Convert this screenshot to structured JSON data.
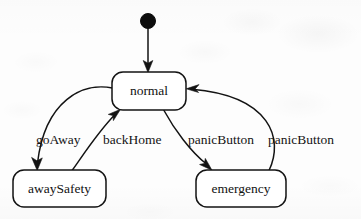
{
  "diagram": {
    "type": "uml-state-machine",
    "title": "",
    "background_color": "#fdfdfd",
    "stroke_color": "#131313",
    "initial_state": {
      "name": "initial-pseudostate",
      "shape": "filled-circle",
      "cx": 148,
      "cy": 21,
      "r": 7.5
    },
    "states": [
      {
        "id": "normal",
        "label": "normal",
        "x": 112,
        "y": 72,
        "width": 74,
        "height": 38,
        "rx": 11
      },
      {
        "id": "awaySafety",
        "label": "awaySafety",
        "x": 13,
        "y": 170,
        "width": 93,
        "height": 37,
        "rx": 11
      },
      {
        "id": "emergency",
        "label": "emergency",
        "x": 196,
        "y": 170,
        "width": 90,
        "height": 37,
        "rx": 11
      }
    ],
    "transitions": [
      {
        "id": "initial-to-normal",
        "label": "",
        "from": "initial-pseudostate",
        "to": "normal",
        "path": "M 148 29 L 148 68",
        "arrow_tip": {
          "x": 148,
          "y": 72,
          "angle": 90
        }
      },
      {
        "id": "normal-to-awaySafety",
        "label": "goAway",
        "from": "normal",
        "to": "awaySafety",
        "label_x": 36,
        "label_y": 141,
        "path": "M 113 87 C 80 84, 42 104, 36 164",
        "arrow_tip": {
          "x": 37,
          "y": 170,
          "angle": 95
        }
      },
      {
        "id": "awaySafety-to-normal",
        "label": "backHome",
        "from": "awaySafety",
        "to": "normal",
        "label_x": 103,
        "label_y": 141,
        "path": "M 74 170 C 82 160, 96 134, 116 113",
        "arrow_tip": {
          "x": 120,
          "y": 109,
          "angle": 311
        }
      },
      {
        "id": "normal-to-emergency",
        "label": "panicButton",
        "from": "normal",
        "to": "emergency",
        "label_x": 188,
        "label_y": 141,
        "path": "M 165 110 C 175 128, 192 152, 207 165",
        "arrow_tip": {
          "x": 212,
          "y": 170,
          "angle": 47
        }
      },
      {
        "id": "emergency-to-normal",
        "label": "panicButton",
        "from": "emergency",
        "to": "normal",
        "label_x": 268,
        "label_y": 141,
        "path": "M 268 170 C 282 140, 272 96, 193 89",
        "arrow_tip": {
          "x": 187,
          "y": 89,
          "angle": 184
        }
      }
    ]
  }
}
